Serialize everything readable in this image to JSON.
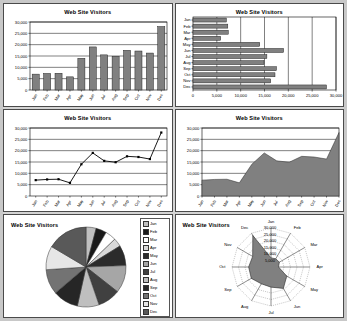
{
  "document": {
    "page_background": "#c8c8c8",
    "sheet_background": "#d4d4d4",
    "panel_background": "#ffffff"
  },
  "common": {
    "title": "Web Site Visitors",
    "categories": [
      "Jan",
      "Feb",
      "Mar",
      "Apr",
      "May",
      "Jun",
      "Jul",
      "Aug",
      "Sep",
      "Oct",
      "Nov",
      "Dec"
    ],
    "values": [
      7000,
      7300,
      7400,
      5800,
      14000,
      19000,
      15500,
      14900,
      17500,
      17200,
      16300,
      28000
    ],
    "axis_ticks": [
      0,
      5000,
      10000,
      15000,
      20000,
      25000,
      30000
    ],
    "axis_tick_labels": [
      "0",
      "5,000",
      "10,000",
      "15,000",
      "20,000",
      "25,000",
      "30,000"
    ],
    "series_color": "#808080",
    "line_color": "#000000",
    "grid_color": "#000000"
  },
  "panels": [
    {
      "id": "column-chart",
      "name": "Web Site Visitors column chart",
      "title": "Web Site Visitors"
    },
    {
      "id": "bar-chart",
      "name": "Web Site Visitors horizontal bar chart",
      "title": "Web Site Visitors"
    },
    {
      "id": "line-chart",
      "name": "Web Site Visitors line chart",
      "title": "Web Site Visitors"
    },
    {
      "id": "area-chart",
      "name": "Web Site Visitors area chart",
      "title": "Web Site Visitors"
    },
    {
      "id": "pie-chart",
      "name": "Web Site Visitors pie chart",
      "title": "Web Site Visitors"
    },
    {
      "id": "radar-chart",
      "name": "Web Site Visitors radar chart",
      "title": "Web Site Visitors"
    }
  ],
  "pie_legend": [
    {
      "label": "Jan",
      "color": "#c0c0c0"
    },
    {
      "label": "Feb",
      "color": "#1a1a1a"
    },
    {
      "label": "Mar",
      "color": "#ffffff"
    },
    {
      "label": "Apr",
      "color": "#d9d9d9"
    },
    {
      "label": "May",
      "color": "#2b2b2b"
    },
    {
      "label": "Jun",
      "color": "#a6a6a6"
    },
    {
      "label": "Jul",
      "color": "#404040"
    },
    {
      "label": "Aug",
      "color": "#bfbfbf"
    },
    {
      "label": "Sep",
      "color": "#262626"
    },
    {
      "label": "Oct",
      "color": "#737373"
    },
    {
      "label": "Nov",
      "color": "#e6e6e6"
    },
    {
      "label": "Dec",
      "color": "#595959"
    }
  ],
  "radar": {
    "rings": [
      5000,
      10000,
      15000,
      20000,
      25000,
      30000
    ],
    "ring_labels": [
      "5,000",
      "10,000",
      "15,000",
      "20,000",
      "25,000",
      "30,000"
    ],
    "max": 30000
  },
  "chart_data": [
    {
      "type": "bar",
      "id": "column-chart",
      "orientation": "vertical",
      "title": "Web Site Visitors",
      "categories": [
        "Jan",
        "Feb",
        "Mar",
        "Apr",
        "May",
        "Jun",
        "Jul",
        "Aug",
        "Sep",
        "Oct",
        "Nov",
        "Dec"
      ],
      "values": [
        7000,
        7300,
        7400,
        5800,
        14000,
        19000,
        15500,
        14900,
        17500,
        17200,
        16300,
        28000
      ],
      "xlabel": "",
      "ylabel": "",
      "ylim": [
        0,
        30000
      ],
      "yticks": [
        0,
        5000,
        10000,
        15000,
        20000,
        25000,
        30000
      ],
      "grid": true,
      "legend": false,
      "bar_color": "#808080"
    },
    {
      "type": "bar",
      "id": "bar-chart",
      "orientation": "horizontal",
      "title": "Web Site Visitors",
      "categories": [
        "Jan",
        "Feb",
        "Mar",
        "Apr",
        "May",
        "Jun",
        "Jul",
        "Aug",
        "Sep",
        "Oct",
        "Nov",
        "Dec"
      ],
      "values": [
        7000,
        7300,
        7400,
        5800,
        14000,
        19000,
        15500,
        14900,
        17500,
        17200,
        16300,
        28000
      ],
      "xlabel": "",
      "ylabel": "",
      "xlim": [
        0,
        30000
      ],
      "xticks": [
        0,
        5000,
        10000,
        15000,
        20000,
        25000,
        30000
      ],
      "grid": true,
      "legend": false,
      "bar_color": "#808080"
    },
    {
      "type": "line",
      "id": "line-chart",
      "title": "Web Site Visitors",
      "x": [
        "Jan",
        "Feb",
        "Mar",
        "Apr",
        "May",
        "Jun",
        "Jul",
        "Aug",
        "Sep",
        "Oct",
        "Nov",
        "Dec"
      ],
      "values": [
        7000,
        7300,
        7400,
        5800,
        14000,
        19000,
        15500,
        14900,
        17500,
        17200,
        16300,
        28000
      ],
      "xlabel": "",
      "ylabel": "",
      "ylim": [
        0,
        30000
      ],
      "yticks": [
        0,
        5000,
        10000,
        15000,
        20000,
        25000,
        30000
      ],
      "grid": true,
      "legend": false,
      "markers": true,
      "line_color": "#000000"
    },
    {
      "type": "area",
      "id": "area-chart",
      "title": "Web Site Visitors",
      "x": [
        "Jan",
        "Feb",
        "Mar",
        "Apr",
        "May",
        "Jun",
        "Jul",
        "Aug",
        "Sep",
        "Oct",
        "Nov",
        "Dec"
      ],
      "values": [
        7000,
        7300,
        7400,
        5800,
        14000,
        19000,
        15500,
        14900,
        17500,
        17200,
        16300,
        28000
      ],
      "xlabel": "",
      "ylabel": "",
      "ylim": [
        0,
        30000
      ],
      "yticks": [
        0,
        5000,
        10000,
        15000,
        20000,
        25000,
        30000
      ],
      "grid": true,
      "legend": false,
      "fill_color": "#808080"
    },
    {
      "type": "pie",
      "id": "pie-chart",
      "title": "Web Site Visitors",
      "labels": [
        "Jan",
        "Feb",
        "Mar",
        "Apr",
        "May",
        "Jun",
        "Jul",
        "Aug",
        "Sep",
        "Oct",
        "Nov",
        "Dec"
      ],
      "values": [
        7000,
        7300,
        7400,
        5800,
        14000,
        19000,
        15500,
        14900,
        17500,
        17200,
        16300,
        28000
      ],
      "legend": true,
      "legend_position": "right"
    },
    {
      "type": "radar",
      "id": "radar-chart",
      "title": "Web Site Visitors",
      "categories": [
        "Jan",
        "Feb",
        "Mar",
        "Apr",
        "May",
        "Jun",
        "Jul",
        "Aug",
        "Sep",
        "Oct",
        "Nov",
        "Dec"
      ],
      "values": [
        7000,
        7300,
        7400,
        5800,
        14000,
        19000,
        15500,
        14900,
        17500,
        17200,
        16300,
        28000
      ],
      "rlim": [
        0,
        30000
      ],
      "rticks": [
        5000,
        10000,
        15000,
        20000,
        25000,
        30000
      ],
      "grid": true,
      "legend": false,
      "fill_color": "#808080"
    }
  ]
}
